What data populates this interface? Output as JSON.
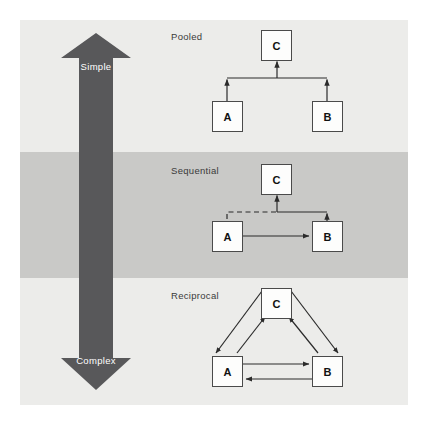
{
  "figure": {
    "background_color": "#ffffff",
    "panel_color_light": "#ececea",
    "panel_color_dark": "#c9c9c7",
    "arrow_color": "#58585a",
    "node_fill": "#fdfdfc",
    "node_stroke": "#4a4a4a",
    "line_color": "#2b2b2b"
  },
  "complexity_arrow": {
    "name": "complexity-scale-arrow",
    "top_label": "Simple",
    "bottom_label": "Complex",
    "color": "#58585a"
  },
  "sections": [
    {
      "id": "pooled",
      "label": "Pooled",
      "nodes": [
        {
          "id": "c",
          "label": "C"
        },
        {
          "id": "a",
          "label": "A"
        },
        {
          "id": "b",
          "label": "B"
        }
      ],
      "edges": [
        {
          "from": "A",
          "to": "C",
          "style": "solid",
          "direction": "one-way"
        },
        {
          "from": "B",
          "to": "C",
          "style": "solid",
          "direction": "one-way"
        }
      ]
    },
    {
      "id": "sequential",
      "label": "Sequential",
      "nodes": [
        {
          "id": "c",
          "label": "C"
        },
        {
          "id": "a",
          "label": "A"
        },
        {
          "id": "b",
          "label": "B"
        }
      ],
      "edges": [
        {
          "from": "A",
          "to": "B",
          "style": "solid",
          "direction": "one-way"
        },
        {
          "from": "B",
          "to": "C",
          "style": "solid",
          "direction": "one-way"
        },
        {
          "from": "A",
          "to": "C",
          "style": "dashed",
          "direction": "one-way"
        }
      ]
    },
    {
      "id": "reciprocal",
      "label": "Reciprocal",
      "nodes": [
        {
          "id": "c",
          "label": "C"
        },
        {
          "id": "a",
          "label": "A"
        },
        {
          "id": "b",
          "label": "B"
        }
      ],
      "edges": [
        {
          "from": "A",
          "to": "C",
          "style": "solid",
          "direction": "two-way"
        },
        {
          "from": "B",
          "to": "C",
          "style": "solid",
          "direction": "two-way"
        },
        {
          "from": "A",
          "to": "B",
          "style": "solid",
          "direction": "two-way"
        }
      ]
    }
  ]
}
